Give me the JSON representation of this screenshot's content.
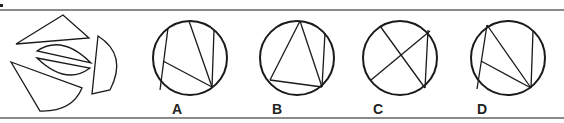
{
  "question": {
    "marker": "•",
    "prompt_figure": {
      "description": "Five cut pieces: triangle, two lens segments, half-disc, circular sector",
      "pieces": [
        "triangle",
        "lens-upper",
        "lens-lower",
        "half-disc",
        "sector"
      ]
    },
    "options": [
      {
        "label": "A",
        "id": "option-a"
      },
      {
        "label": "B",
        "id": "option-b"
      },
      {
        "label": "C",
        "id": "option-c"
      },
      {
        "label": "D",
        "id": "option-d"
      }
    ]
  },
  "colors": {
    "stroke": "#1a1a1a",
    "rule": "#8a8a8a",
    "background": "#ffffff"
  }
}
